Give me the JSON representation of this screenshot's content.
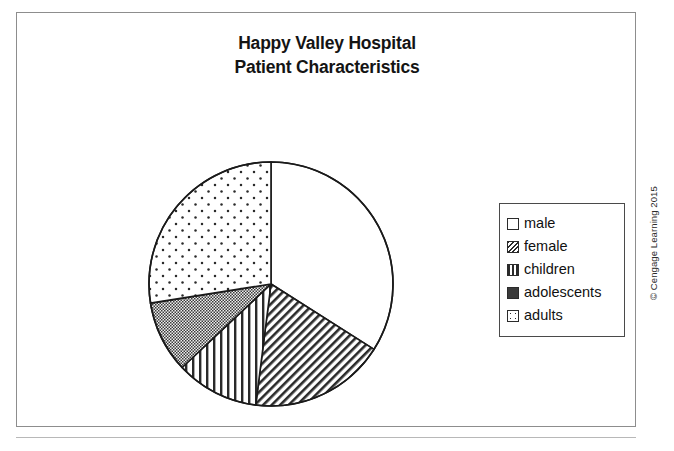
{
  "figure": {
    "title_line1": "Happy Valley Hospital",
    "title_line2": "Patient Characteristics",
    "credit": "© Cengage Learning 2015",
    "border_color": "#8d8d8d",
    "background": "#ffffff"
  },
  "legend": {
    "position": "right",
    "entries": [
      {
        "label": "male",
        "pattern": "solid-white",
        "swatch_name": "legend-swatch-male"
      },
      {
        "label": "female",
        "pattern": "diagonal-hatch",
        "swatch_name": "legend-swatch-female"
      },
      {
        "label": "children",
        "pattern": "vertical-lines",
        "swatch_name": "legend-swatch-children"
      },
      {
        "label": "adolescents",
        "pattern": "dense-dots-gray",
        "swatch_name": "legend-swatch-adolescents"
      },
      {
        "label": "adults",
        "pattern": "sparse-dots",
        "swatch_name": "legend-swatch-adults"
      }
    ]
  },
  "chart_data": {
    "type": "pie",
    "title": "Happy Valley Hospital Patient Characteristics",
    "xlabel": "",
    "ylabel": "",
    "legend_position": "right",
    "grid": false,
    "start_angle_deg": 0,
    "direction": "clockwise",
    "categories": [
      "male",
      "female",
      "children",
      "adolescents",
      "adults"
    ],
    "values": [
      34,
      18,
      11,
      9.5,
      27.5
    ],
    "units": "percent",
    "slices": [
      {
        "label": "male",
        "percent": 34,
        "start_deg": 0,
        "end_deg": 122.4,
        "fill": "solid-white",
        "edge_color": "#1a1a1a"
      },
      {
        "label": "female",
        "percent": 18,
        "start_deg": 122.4,
        "end_deg": 187.2,
        "fill": "diagonal-hatch",
        "edge_color": "#1a1a1a"
      },
      {
        "label": "children",
        "percent": 11,
        "start_deg": 187.2,
        "end_deg": 226.8,
        "fill": "vertical-lines",
        "edge_color": "#1a1a1a"
      },
      {
        "label": "adolescents",
        "percent": 9.5,
        "start_deg": 226.8,
        "end_deg": 261.0,
        "fill": "dense-dots-gray",
        "edge_color": "#1a1a1a"
      },
      {
        "label": "adults",
        "percent": 27.5,
        "start_deg": 261.0,
        "end_deg": 360.0,
        "fill": "sparse-dots",
        "edge_color": "#1a1a1a"
      }
    ],
    "geometry": {
      "center_x": 254,
      "center_y": 271,
      "radius": 122
    }
  }
}
